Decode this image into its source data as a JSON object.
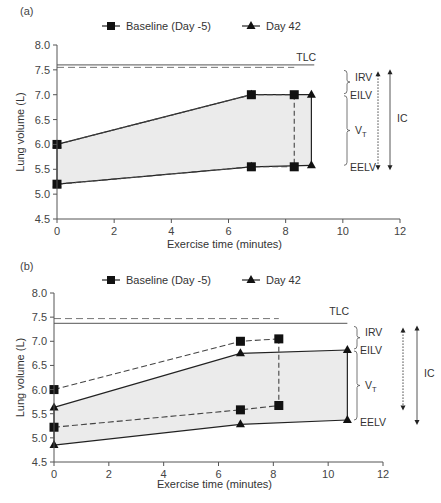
{
  "chart_data": [
    {
      "panel": "(a)",
      "type": "line",
      "title": "",
      "xlabel": "Exercise time (minutes)",
      "ylabel": "Lung volume (L)",
      "xlim": [
        0,
        12
      ],
      "ylim": [
        4.5,
        8.0
      ],
      "xticks": [
        0,
        2,
        4,
        6,
        8,
        10,
        12
      ],
      "yticks": [
        4.5,
        5.0,
        5.5,
        6.0,
        6.5,
        7.0,
        7.5,
        8.0
      ],
      "ytick_labels": [
        "4.5",
        "5.0",
        "5.5",
        "6.0",
        "6.5",
        "7.0",
        "7.5",
        "8.0"
      ],
      "grid": false,
      "legend": [
        "Baseline (Day -5)",
        "Day 42"
      ],
      "legend_position": "top",
      "series": [
        {
          "name": "Baseline (Day -5) EILV",
          "marker": "square",
          "line": "dashed",
          "x": [
            0,
            6.8,
            8.3
          ],
          "y": [
            6.0,
            7.0,
            7.0
          ]
        },
        {
          "name": "Baseline (Day -5) EELV",
          "marker": "square",
          "line": "dashed",
          "x": [
            0,
            6.8,
            8.3
          ],
          "y": [
            5.2,
            5.55,
            5.55
          ]
        },
        {
          "name": "Day 42 EILV",
          "marker": "triangle",
          "line": "solid",
          "x": [
            0,
            6.8,
            8.9
          ],
          "y": [
            6.0,
            7.0,
            7.0
          ]
        },
        {
          "name": "Day 42 EELV",
          "marker": "triangle",
          "line": "solid",
          "x": [
            0,
            6.8,
            8.9
          ],
          "y": [
            5.2,
            5.55,
            5.58
          ]
        }
      ],
      "tlc": {
        "baseline": {
          "value": 7.55,
          "x_end": 8.3,
          "line": "dashed"
        },
        "day42": {
          "value": 7.6,
          "x_end": 9.0,
          "line": "solid"
        }
      },
      "annotations": [
        "TLC",
        "IRV",
        "EILV",
        "VT",
        "EELV",
        "IC"
      ]
    },
    {
      "panel": "(b)",
      "type": "line",
      "title": "",
      "xlabel": "Exercise time (minutes)",
      "ylabel": "Lung volume (L)",
      "xlim": [
        0,
        12
      ],
      "ylim": [
        4.5,
        8.0
      ],
      "xticks": [
        0,
        2,
        4,
        6,
        8,
        10,
        12
      ],
      "yticks": [
        4.5,
        5.0,
        5.5,
        6.0,
        6.5,
        7.0,
        7.5,
        8.0
      ],
      "ytick_labels": [
        "4.5",
        "5.0",
        "5.5",
        "6.0",
        "6.5",
        "7.0",
        "7.5",
        "8.0"
      ],
      "grid": false,
      "legend": [
        "Baseline (Day -5)",
        "Day 42"
      ],
      "legend_position": "top",
      "series": [
        {
          "name": "Baseline (Day -5) EILV",
          "marker": "square",
          "line": "dashed",
          "x": [
            0,
            6.8,
            8.2
          ],
          "y": [
            6.0,
            7.0,
            7.05
          ]
        },
        {
          "name": "Baseline (Day -5) EELV",
          "marker": "square",
          "line": "dashed",
          "x": [
            0,
            6.8,
            8.2
          ],
          "y": [
            5.22,
            5.58,
            5.67
          ]
        },
        {
          "name": "Day 42 EILV",
          "marker": "triangle",
          "line": "solid",
          "x": [
            0,
            6.8,
            10.7
          ],
          "y": [
            5.63,
            6.75,
            6.82
          ]
        },
        {
          "name": "Day 42 EELV",
          "marker": "triangle",
          "line": "solid",
          "x": [
            0,
            6.8,
            10.7
          ],
          "y": [
            4.85,
            5.28,
            5.37
          ]
        }
      ],
      "tlc": {
        "baseline": {
          "value": 7.47,
          "x_end": 8.2,
          "line": "dashed"
        },
        "day42": {
          "value": 7.37,
          "x_end": 10.7,
          "line": "solid"
        }
      },
      "annotations": [
        "TLC",
        "IRV",
        "EILV",
        "VT",
        "EELV",
        "IC"
      ]
    }
  ],
  "labels": {
    "panel_a": "(a)",
    "panel_b": "(b)",
    "legend_baseline": "Baseline (Day -5)",
    "legend_day42": "Day 42",
    "xlabel": "Exercise time (minutes)",
    "ylabel": "Lung volume (L)",
    "tlc": "TLC",
    "irv": "IRV",
    "eilv": "EILV",
    "vt_main": "V",
    "vt_sub": "T",
    "eelv": "EELV",
    "ic": "IC"
  },
  "colors": {
    "fill": "#ebebeb",
    "line": "#222222",
    "dashed": "#444444",
    "axis": "#555555",
    "tlc_line": "#777777"
  }
}
